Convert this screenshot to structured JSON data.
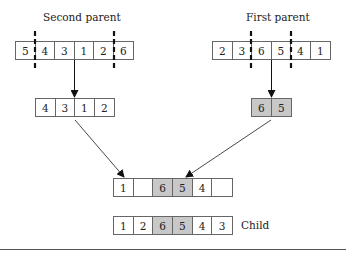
{
  "labels": {
    "second_parent": "Second parent",
    "first_parent": "First parent",
    "child": "Child"
  },
  "second_parent": {
    "cells": [
      "5",
      "4",
      "3",
      "1",
      "2",
      "6"
    ],
    "cut_after": [
      0,
      4
    ]
  },
  "first_parent": {
    "cells": [
      "2",
      "3",
      "6",
      "5",
      "4",
      "1"
    ],
    "cut_after": [
      1,
      3
    ]
  },
  "second_remaining": {
    "cells": [
      "4",
      "3",
      "1",
      "2"
    ]
  },
  "first_segment": {
    "cells": [
      "6",
      "5"
    ],
    "shaded": true
  },
  "intermediate": {
    "cells": [
      "1",
      "",
      "6",
      "5",
      "4",
      ""
    ],
    "shaded_indices": [
      2,
      3
    ]
  },
  "child": {
    "cells": [
      "1",
      "2",
      "6",
      "5",
      "4",
      "3"
    ],
    "shaded_indices": [
      2,
      3
    ]
  },
  "colors": {
    "shaded": "#c8c8c8",
    "border": "#666666"
  }
}
